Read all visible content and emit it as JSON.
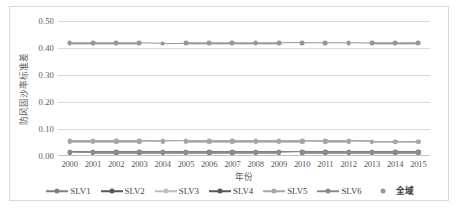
{
  "chart_data": {
    "type": "line",
    "title": "",
    "xlabel": "年份",
    "ylabel": "防风固沙率标准差",
    "categories": [
      "2000",
      "2001",
      "2002",
      "2003",
      "2004",
      "2005",
      "2006",
      "2007",
      "2008",
      "2009",
      "2010",
      "2011",
      "2012",
      "2013",
      "2014",
      "2015"
    ],
    "ylim": [
      0.0,
      0.5
    ],
    "ytick_labels": [
      "0.50",
      "0.40",
      "0.30",
      "0.20",
      "0.10",
      "0.00"
    ],
    "ytick_values": [
      0.5,
      0.4,
      0.3,
      0.2,
      0.1,
      0.0
    ],
    "ystep": 0.1,
    "grid": "horizontal",
    "legend_position": "bottom",
    "series": [
      {
        "name": "SLV1",
        "color": "#808080",
        "marker": "circle",
        "values": [
          0.055,
          0.055,
          0.055,
          0.055,
          0.054,
          0.055,
          0.055,
          0.055,
          0.055,
          0.055,
          0.055,
          0.054,
          0.054,
          0.053,
          0.053,
          0.053
        ]
      },
      {
        "name": "SLV2",
        "color": "#595959",
        "marker": "circle",
        "values": [
          0.014,
          0.013,
          0.013,
          0.013,
          0.013,
          0.013,
          0.013,
          0.013,
          0.013,
          0.013,
          0.014,
          0.014,
          0.014,
          0.014,
          0.014,
          0.014
        ]
      },
      {
        "name": "SLV3",
        "color": "#bfbfbf",
        "marker": "circle",
        "values": [
          0.055,
          0.055,
          0.055,
          0.055,
          0.054,
          0.055,
          0.055,
          0.055,
          0.055,
          0.055,
          0.055,
          0.054,
          0.054,
          0.053,
          0.053,
          0.053
        ]
      },
      {
        "name": "SLV4",
        "color": "#595959",
        "marker": "circle",
        "values": [
          0.014,
          0.013,
          0.013,
          0.013,
          0.013,
          0.013,
          0.013,
          0.013,
          0.013,
          0.013,
          0.014,
          0.014,
          0.014,
          0.014,
          0.014,
          0.014
        ]
      },
      {
        "name": "SLV5",
        "color": "#a6a6a6",
        "marker": "circle",
        "values": [
          0.055,
          0.055,
          0.055,
          0.055,
          0.054,
          0.055,
          0.055,
          0.055,
          0.055,
          0.055,
          0.055,
          0.054,
          0.054,
          0.053,
          0.053,
          0.053
        ]
      },
      {
        "name": "SLV6",
        "color": "#8c8c8c",
        "marker": "circle",
        "values": [
          0.014,
          0.013,
          0.013,
          0.013,
          0.013,
          0.013,
          0.013,
          0.013,
          0.013,
          0.013,
          0.014,
          0.014,
          0.014,
          0.014,
          0.014,
          0.014
        ]
      },
      {
        "name": "全域",
        "color": "#969696",
        "marker": "circle",
        "values": [
          0.418,
          0.418,
          0.418,
          0.418,
          0.416,
          0.418,
          0.418,
          0.418,
          0.418,
          0.418,
          0.419,
          0.419,
          0.419,
          0.418,
          0.418,
          0.418
        ]
      }
    ]
  },
  "legend": {
    "items": [
      {
        "label": "SLV1",
        "color": "#808080",
        "style": "line-marker"
      },
      {
        "label": "SLV2",
        "color": "#595959",
        "style": "line-marker"
      },
      {
        "label": "SLV3",
        "color": "#bfbfbf",
        "style": "line-marker"
      },
      {
        "label": "SLV4",
        "color": "#595959",
        "style": "line-marker"
      },
      {
        "label": "SLV5",
        "color": "#a6a6a6",
        "style": "line-marker"
      },
      {
        "label": "SLV6",
        "color": "#8c8c8c",
        "style": "line-marker"
      },
      {
        "label": "全域",
        "color": "#969696",
        "style": "marker-only"
      }
    ]
  },
  "style": {
    "border_color": "#d9d9d9",
    "gridline_color": "#d9d9d9",
    "axis_color": "#bfbfbf",
    "tick_label_color": "#595959",
    "background": "#ffffff"
  }
}
